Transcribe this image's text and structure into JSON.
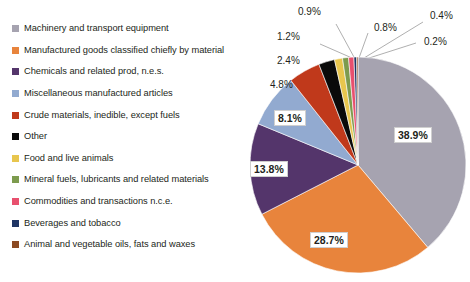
{
  "chart_data": {
    "type": "pie",
    "title": "",
    "subtitle": "",
    "xlabel": "",
    "ylabel": "",
    "legend_position": "left",
    "grid": false,
    "value_unit": "%",
    "categories": [
      "Machinery and transport equipment",
      "Manufactured goods classified chiefly by material",
      "Chemicals and related prod, n.e.s.",
      "Miscellaneous manufactured articles",
      "Crude materials, inedible, except fuels",
      "Other",
      "Food and live animals",
      "Mineral fuels, lubricants and related materials",
      "Commodities and transactions n.c.e.",
      "Beverages and tobacco",
      "Animal and vegetable oils, fats and waxes"
    ],
    "values": [
      38.9,
      28.7,
      13.8,
      8.1,
      4.8,
      2.4,
      1.2,
      0.9,
      0.8,
      0.4,
      0.2
    ],
    "value_labels": [
      "38.9%",
      "28.7%",
      "13.8%",
      "8.1%",
      "4.8%",
      "2.4%",
      "1.2%",
      "0.9%",
      "0.8%",
      "0.4%",
      "0.2%"
    ],
    "colors": [
      "#A6A3B0",
      "#E8843C",
      "#54356B",
      "#92AAD0",
      "#C0391B",
      "#0A0A0A",
      "#E8C64E",
      "#7D9B4E",
      "#E8506E",
      "#1F3564",
      "#8B4A22"
    ],
    "slices": [
      {
        "label": "Machinery and transport equipment",
        "value": 38.9,
        "value_label": "38.9%",
        "color": "#A6A3B0",
        "label_style": "inner"
      },
      {
        "label": "Manufactured goods classified chiefly by material",
        "value": 28.7,
        "value_label": "28.7%",
        "color": "#E8843C",
        "label_style": "inner"
      },
      {
        "label": "Chemicals and related prod, n.e.s.",
        "value": 13.8,
        "value_label": "13.8%",
        "color": "#54356B",
        "label_style": "inner"
      },
      {
        "label": "Miscellaneous manufactured articles",
        "value": 8.1,
        "value_label": "8.1%",
        "color": "#92AAD0",
        "label_style": "inner"
      },
      {
        "label": "Crude materials, inedible, except fuels",
        "value": 4.8,
        "value_label": "4.8%",
        "color": "#C0391B",
        "label_style": "outer"
      },
      {
        "label": "Other",
        "value": 2.4,
        "value_label": "2.4%",
        "color": "#0A0A0A",
        "label_style": "outer"
      },
      {
        "label": "Food and live animals",
        "value": 1.2,
        "value_label": "1.2%",
        "color": "#E8C64E",
        "label_style": "outer"
      },
      {
        "label": "Mineral fuels, lubricants and related materials",
        "value": 0.9,
        "value_label": "0.9%",
        "color": "#7D9B4E",
        "label_style": "outer"
      },
      {
        "label": "Commodities and transactions n.c.e.",
        "value": 0.8,
        "value_label": "0.8%",
        "color": "#E8506E",
        "label_style": "outer"
      },
      {
        "label": "Beverages and tobacco",
        "value": 0.4,
        "value_label": "0.4%",
        "color": "#1F3564",
        "label_style": "outer"
      },
      {
        "label": "Animal and vegetable oils, fats and waxes",
        "value": 0.2,
        "value_label": "0.2%",
        "color": "#8B4A22",
        "label_style": "outer"
      }
    ]
  },
  "legend": {
    "items": [
      {
        "label": "Machinery and transport equipment",
        "color": "#A6A3B0"
      },
      {
        "label": "Manufactured goods classified chiefly by material",
        "color": "#E8843C"
      },
      {
        "label": "Chemicals and related prod, n.e.s.",
        "color": "#54356B"
      },
      {
        "label": "Miscellaneous manufactured articles",
        "color": "#92AAD0"
      },
      {
        "label": "Crude materials, inedible, except fuels",
        "color": "#C0391B"
      },
      {
        "label": "Other",
        "color": "#0A0A0A"
      },
      {
        "label": "Food and live animals",
        "color": "#E8C64E"
      },
      {
        "label": "Mineral fuels, lubricants and related materials",
        "color": "#7D9B4E"
      },
      {
        "label": "Commodities and transactions n.c.e.",
        "color": "#E8506E"
      },
      {
        "label": "Beverages and tobacco",
        "color": "#1F3564"
      },
      {
        "label": "Animal and vegetable oils, fats and waxes",
        "color": "#8B4A22"
      }
    ]
  },
  "callouts": {
    "c_09": "0.9%",
    "c_08": "0.8%",
    "c_04": "0.4%",
    "c_02": "0.2%",
    "c_12": "1.2%",
    "c_24": "2.4%",
    "c_48": "4.8%"
  },
  "inner_labels": {
    "l_389": "38.9%",
    "l_287": "28.7%",
    "l_138": "13.8%",
    "l_81": "8.1%"
  }
}
